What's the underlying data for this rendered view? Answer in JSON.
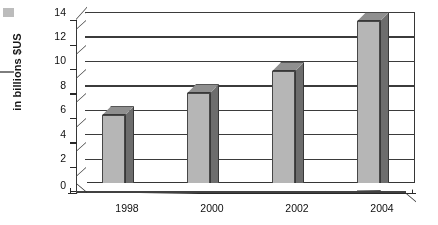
{
  "chart_data": {
    "type": "bar",
    "title": "",
    "subtitle": "",
    "xlabel": "",
    "ylabel": "in billions $US",
    "categories": [
      "1998",
      "2000",
      "2002",
      "2004"
    ],
    "values": [
      6.2,
      8.0,
      9.8,
      13.9
    ],
    "series": [
      {
        "name": "",
        "values": [
          6.2,
          8.0,
          9.8,
          13.9
        ]
      }
    ],
    "ylim": [
      0,
      14
    ],
    "y_ticks": [
      "0",
      "2",
      "4",
      "6",
      "8",
      "10",
      "12",
      "14"
    ],
    "y_tick_values": [
      0,
      2,
      4,
      6,
      8,
      10,
      12,
      14
    ],
    "grid": true,
    "grid_axis": "y",
    "legend": false,
    "legend_position": "none",
    "style": "3d-column",
    "annotations": []
  },
  "colors": {
    "bar_front": "#b3b3b3",
    "bar_side": "#6e6e6e",
    "bar_top": "#8e8e8e",
    "bar_outline": "#3c3c3c",
    "gridline": "#3f3f3f",
    "axis": "#2e2e2e",
    "plot_background": "#ffffff",
    "page_background": "#ffffff",
    "text": "#151515"
  },
  "artifacts": {
    "top_left_square": "scan-artifact",
    "left_dash": "scan-artifact"
  }
}
